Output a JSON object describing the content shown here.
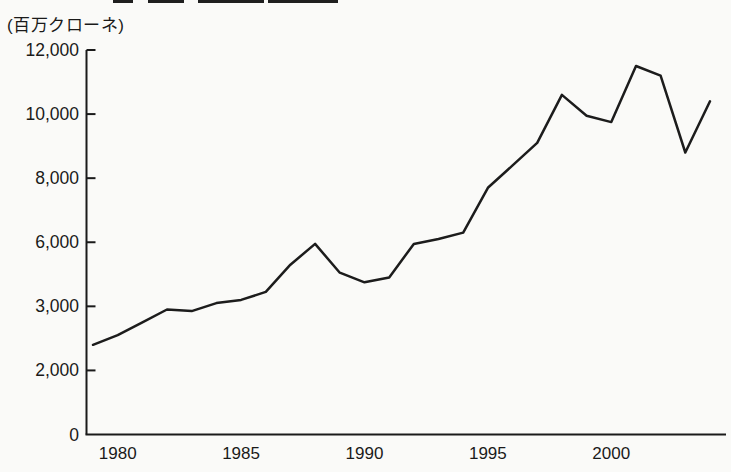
{
  "page": {
    "background_color": "#fafaf8",
    "ink_color": "#1a1a1a",
    "cropped_title_remnant_visible": true
  },
  "chart_data": {
    "type": "line",
    "title": "",
    "unit_label": "(百万クローネ)",
    "x": [
      1979,
      1980,
      1981,
      1982,
      1983,
      1984,
      1985,
      1986,
      1987,
      1988,
      1989,
      1990,
      1991,
      1992,
      1993,
      1994,
      1995,
      1996,
      1997,
      1998,
      1999,
      2000,
      2001,
      2002,
      2003,
      2004
    ],
    "values": [
      2800,
      3100,
      3500,
      3900,
      3850,
      4100,
      4200,
      4450,
      5300,
      5950,
      5050,
      4750,
      4900,
      5950,
      6100,
      6300,
      7700,
      8400,
      9100,
      10600,
      9950,
      9750,
      11500,
      11200,
      8800,
      10400
    ],
    "x_tick_labels": [
      "1980",
      "1985",
      "1990",
      "1995",
      "2000"
    ],
    "y_tick_values": [
      0,
      2000,
      4000,
      6000,
      8000,
      10000,
      12000
    ],
    "y_tick_labels_as_printed": [
      "0",
      "2,000",
      "3,000",
      "6,000",
      "8,000",
      "10,000",
      "12,000"
    ],
    "ylim": [
      0,
      12000
    ],
    "grid": false,
    "legend": null,
    "line_color": "#1c1c1c",
    "note_on_axis": "printed tick label 3,000 occupies the evenly-spaced position where 4,000 would fall (as in source scan)"
  }
}
